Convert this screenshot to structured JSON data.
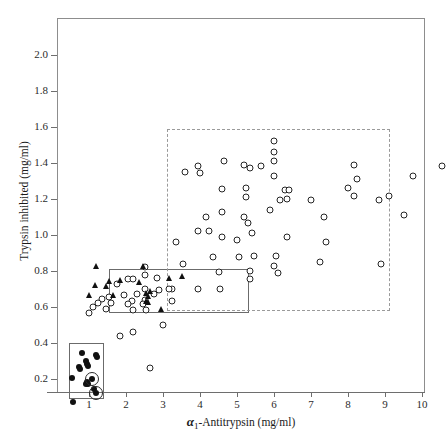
{
  "chart_data": {
    "type": "scatter",
    "title": "",
    "xlabel": "α₁-Antitrypsin  (mg/ml)",
    "ylabel": "Trypsin inhibited  (mg/ml)",
    "xlim": [
      0.3,
      10.9
    ],
    "ylim": [
      0.05,
      2.18
    ],
    "xticks": [
      1,
      2,
      3,
      4,
      5,
      6,
      7,
      8,
      9,
      10
    ],
    "xtick_labels": [
      "1",
      "2",
      "3",
      "4",
      "5",
      "6",
      "7",
      "8",
      "9",
      "10"
    ],
    "yticks": [
      0.2,
      0.4,
      0.6,
      0.8,
      1.0,
      1.2,
      1.4,
      1.6,
      1.8,
      2.0
    ],
    "ytick_labels": [
      "0.2",
      "0.4",
      "0.6",
      "0.8",
      "1.0",
      "1.2",
      "1.4",
      "1.6",
      "1.8",
      "2.0"
    ],
    "grid": false,
    "legend": "none",
    "axis_title_x_alpha": "α",
    "axis_title_x_sub": "1",
    "axis_title_x_rest": "-Antitrypsin  (mg/ml)",
    "series": [
      {
        "name": "normal-MM",
        "marker": "open-circle",
        "points": [
          [
            6.0,
            1.52
          ],
          [
            6.0,
            1.46
          ],
          [
            6.0,
            1.41
          ],
          [
            4.65,
            1.41
          ],
          [
            3.95,
            1.385
          ],
          [
            5.2,
            1.39
          ],
          [
            5.65,
            1.385
          ],
          [
            5.35,
            1.375
          ],
          [
            6.0,
            1.33
          ],
          [
            3.6,
            1.35
          ],
          [
            4.0,
            1.345
          ],
          [
            8.15,
            1.39
          ],
          [
            10.55,
            1.385
          ],
          [
            8.25,
            1.31
          ],
          [
            9.75,
            1.33
          ],
          [
            5.25,
            1.26
          ],
          [
            5.25,
            1.21
          ],
          [
            4.6,
            1.255
          ],
          [
            6.3,
            1.25
          ],
          [
            6.35,
            1.2
          ],
          [
            6.4,
            1.25
          ],
          [
            6.15,
            1.195
          ],
          [
            7.0,
            1.195
          ],
          [
            8.15,
            1.215
          ],
          [
            9.1,
            1.215
          ],
          [
            8.85,
            1.195
          ],
          [
            8.0,
            1.26
          ],
          [
            4.6,
            1.13
          ],
          [
            4.15,
            1.1
          ],
          [
            5.2,
            1.1
          ],
          [
            5.3,
            1.065
          ],
          [
            5.9,
            1.14
          ],
          [
            7.35,
            1.1
          ],
          [
            9.5,
            1.11
          ],
          [
            3.95,
            1.02
          ],
          [
            4.25,
            1.02
          ],
          [
            4.6,
            0.99
          ],
          [
            5.0,
            0.975
          ],
          [
            5.4,
            1.01
          ],
          [
            3.35,
            0.96
          ],
          [
            6.35,
            0.99
          ],
          [
            7.4,
            0.96
          ],
          [
            5.05,
            0.88
          ],
          [
            5.45,
            0.885
          ],
          [
            6.05,
            0.885
          ],
          [
            4.35,
            0.88
          ],
          [
            3.55,
            0.84
          ],
          [
            6.0,
            0.83
          ],
          [
            7.25,
            0.85
          ],
          [
            8.9,
            0.84
          ],
          [
            5.35,
            0.8
          ],
          [
            4.5,
            0.795
          ],
          [
            5.35,
            0.755
          ],
          [
            6.1,
            0.79
          ],
          [
            3.25,
            0.7
          ],
          [
            3.95,
            0.7
          ],
          [
            4.55,
            0.7
          ],
          [
            2.2,
            0.46
          ],
          [
            3.0,
            0.5
          ],
          [
            2.65,
            0.26
          ],
          [
            1.85,
            0.44
          ]
        ]
      },
      {
        "name": "heterozygote-MZ",
        "marker": "open-circle",
        "points": [
          [
            2.5,
            0.82
          ],
          [
            2.5,
            0.78
          ],
          [
            2.85,
            0.76
          ],
          [
            2.05,
            0.755
          ],
          [
            2.2,
            0.755
          ],
          [
            1.75,
            0.73
          ],
          [
            2.5,
            0.7
          ],
          [
            2.9,
            0.695
          ],
          [
            3.15,
            0.7
          ],
          [
            2.3,
            0.67
          ],
          [
            2.75,
            0.675
          ],
          [
            1.95,
            0.665
          ],
          [
            1.55,
            0.655
          ],
          [
            1.35,
            0.645
          ],
          [
            2.15,
            0.635
          ],
          [
            2.5,
            0.64
          ],
          [
            3.25,
            0.635
          ],
          [
            1.25,
            0.625
          ],
          [
            1.6,
            0.62
          ],
          [
            2.05,
            0.615
          ],
          [
            2.45,
            0.615
          ],
          [
            1.1,
            0.6
          ],
          [
            1.45,
            0.59
          ],
          [
            2.2,
            0.585
          ],
          [
            2.55,
            0.585
          ],
          [
            1.0,
            0.565
          ]
        ]
      },
      {
        "name": "heterozygote-triangle",
        "marker": "filled-triangle",
        "points": [
          [
            1.2,
            0.825
          ],
          [
            2.45,
            0.825
          ],
          [
            1.55,
            0.74
          ],
          [
            1.85,
            0.745
          ],
          [
            3.15,
            0.755
          ],
          [
            2.35,
            0.735
          ],
          [
            3.5,
            0.765
          ],
          [
            1.15,
            0.715
          ],
          [
            1.45,
            0.71
          ],
          [
            2.55,
            0.675
          ],
          [
            2.6,
            0.655
          ],
          [
            2.65,
            0.685
          ],
          [
            1.0,
            0.66
          ],
          [
            1.65,
            0.66
          ],
          [
            2.55,
            0.63
          ],
          [
            2.6,
            0.625
          ],
          [
            2.95,
            0.585
          ]
        ]
      },
      {
        "name": "homozygote-ZZ",
        "marker": "filled-circle",
        "points": [
          [
            0.82,
            0.345
          ],
          [
            1.18,
            0.335
          ],
          [
            1.22,
            0.32
          ],
          [
            0.92,
            0.3
          ],
          [
            0.95,
            0.285
          ],
          [
            0.98,
            0.275
          ],
          [
            0.72,
            0.265
          ],
          [
            0.75,
            0.255
          ],
          [
            0.55,
            0.205
          ],
          [
            1.08,
            0.2
          ],
          [
            0.95,
            0.185
          ],
          [
            0.93,
            0.175
          ],
          [
            0.98,
            0.175
          ],
          [
            1.13,
            0.145
          ],
          [
            1.18,
            0.125
          ],
          [
            0.58,
            0.075
          ]
        ]
      },
      {
        "name": "highlighted-ZZ-rings",
        "marker": "ring",
        "points": [
          [
            1.08,
            0.2
          ],
          [
            1.18,
            0.125
          ]
        ]
      }
    ],
    "group_boxes": [
      {
        "name": "zz-box",
        "style": "solid",
        "x0": 0.46,
        "x1": 1.4,
        "y0": 0.09,
        "y1": 0.4
      },
      {
        "name": "mz-box",
        "style": "solid",
        "x0": 1.55,
        "x1": 5.33,
        "y0": 0.565,
        "y1": 0.81
      },
      {
        "name": "mm-box",
        "style": "dashed",
        "x0": 3.1,
        "x1": 9.13,
        "y0": 0.58,
        "y1": 1.59
      }
    ]
  },
  "caption": ""
}
